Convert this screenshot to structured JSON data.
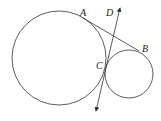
{
  "diagram": {
    "type": "geometry",
    "labels": {
      "A": "A",
      "B": "B",
      "C": "C",
      "D": "D"
    },
    "circles": [
      {
        "name": "large-circle",
        "cx": 59,
        "cy": 58,
        "r": 47
      },
      {
        "name": "small-circle",
        "cx": 129,
        "cy": 74,
        "r": 24
      }
    ],
    "segments": [
      {
        "name": "tangent-AB",
        "from": "A",
        "to": "B"
      }
    ],
    "lines": [
      {
        "name": "tangent-line-CD",
        "through": [
          "C",
          "D"
        ],
        "arrows": "both"
      }
    ],
    "colors": {
      "stroke": "#333333",
      "background": "#ffffff"
    }
  }
}
